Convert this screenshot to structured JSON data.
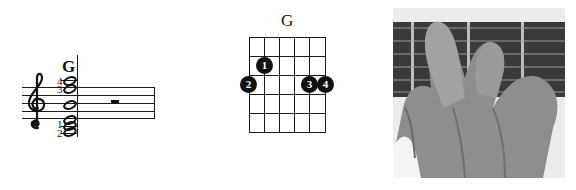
{
  "notation": {
    "chord_name": "G",
    "clef": "treble-clef",
    "fingerings": {
      "top_1": "4",
      "top_2": "3",
      "bottom_1": "1",
      "bottom_2": "2"
    },
    "rest": "half-rest"
  },
  "chord_diagram": {
    "title": "G",
    "strings": 6,
    "frets": 5,
    "dots": [
      {
        "finger": "1",
        "string": 2,
        "fret": 2
      },
      {
        "finger": "2",
        "string": 1,
        "fret": 3
      },
      {
        "finger": "3",
        "string": 5,
        "fret": 3
      },
      {
        "finger": "4",
        "string": 6,
        "fret": 3
      }
    ]
  },
  "photo": {
    "description": "Left hand fretting a G chord on guitar fretboard"
  }
}
